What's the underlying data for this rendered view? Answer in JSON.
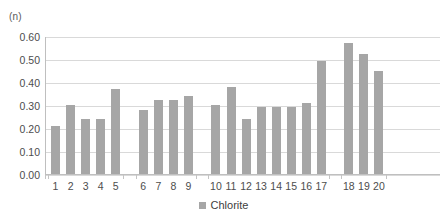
{
  "chart_data": {
    "type": "bar",
    "title": "",
    "subtitle": "",
    "xlabel": "",
    "ylabel": "(n)",
    "ylim": [
      0,
      0.6
    ],
    "ytick_labels": [
      "0.60",
      "0.50",
      "0.40",
      "0.30",
      "0.20",
      "0.10",
      "0.00"
    ],
    "ytick_values": [
      0.6,
      0.5,
      0.4,
      0.3,
      0.2,
      0.1,
      0.0
    ],
    "ytick_step": 0.1,
    "grid": true,
    "grid_axis": "y",
    "legend": {
      "position": "bottom-center",
      "entries": [
        {
          "name": "Chlorite",
          "color": "#a6a6a6"
        }
      ]
    },
    "categories": [
      "1",
      "2",
      "3",
      "4",
      "5",
      "6",
      "7",
      "8",
      "9",
      "10",
      "11",
      "12",
      "13",
      "14",
      "15",
      "16",
      "17",
      "18",
      "19",
      "20"
    ],
    "values": [
      0.21,
      0.3,
      0.24,
      0.24,
      0.37,
      0.28,
      0.32,
      0.32,
      0.34,
      0.3,
      0.38,
      0.24,
      0.29,
      0.29,
      0.29,
      0.31,
      0.49,
      0.57,
      0.52,
      0.45
    ],
    "series": [
      {
        "name": "Chlorite",
        "color": "#a6a6a6",
        "values": [
          0.21,
          0.3,
          0.24,
          0.24,
          0.37,
          0.28,
          0.32,
          0.32,
          0.34,
          0.3,
          0.38,
          0.24,
          0.29,
          0.29,
          0.29,
          0.31,
          0.49,
          0.57,
          0.52,
          0.45
        ]
      }
    ],
    "groups": [
      {
        "label": "",
        "categories": [
          "1",
          "2",
          "3",
          "4",
          "5"
        ]
      },
      {
        "label": "",
        "categories": [
          "6",
          "7",
          "8",
          "9"
        ]
      },
      {
        "label": "",
        "categories": [
          "10",
          "11",
          "12",
          "13",
          "14",
          "15",
          "16",
          "17"
        ]
      },
      {
        "label": "",
        "categories": [
          "18",
          "19",
          "20"
        ]
      }
    ],
    "colors": {
      "bar": "#a6a6a6",
      "gridline": "#d9d9d9",
      "axis": "#bfbfbf",
      "text": "#4d4d4d",
      "background": "#ffffff"
    }
  }
}
